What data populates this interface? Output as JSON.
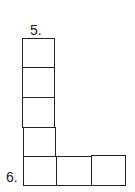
{
  "puzzle": {
    "clues": [
      {
        "number_label": "5.",
        "direction": "down",
        "length": 5
      },
      {
        "number_label": "6.",
        "direction": "across",
        "length": 3
      }
    ],
    "cells": {
      "down_5": [
        "",
        "",
        "",
        "",
        ""
      ],
      "across_6_extra": [
        "",
        ""
      ]
    },
    "colors": {
      "line": "#222222",
      "background": "#ffffff"
    }
  }
}
